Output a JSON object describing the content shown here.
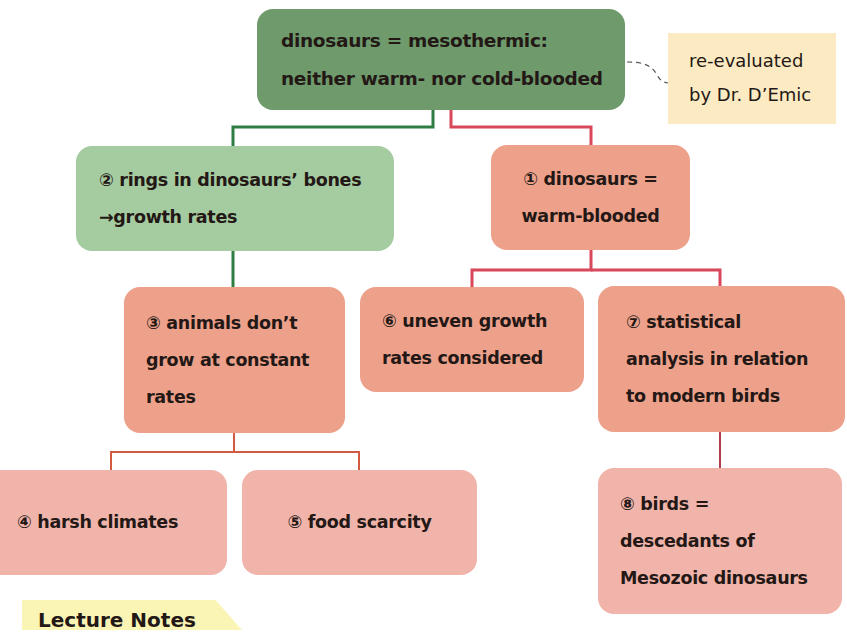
{
  "diagram": {
    "root": {
      "lines": [
        "dinosaurs = mesothermic:",
        "neither warm- nor cold-blooded"
      ],
      "color": "#6e9a6c"
    },
    "note": {
      "lines": [
        "re-evaluated",
        "by Dr. D’Emic"
      ],
      "color": "#fbeac2"
    },
    "nodes": {
      "n1": {
        "lines": [
          "① dinosaurs =",
          "warm-blooded"
        ],
        "color": "#eda08a"
      },
      "n2": {
        "lines": [
          "② rings in dinosaurs’ bones",
          "→growth rates"
        ],
        "color": "#a5cba0"
      },
      "n3": {
        "lines": [
          "③ animals don’t",
          "grow at constant",
          "rates"
        ],
        "color": "#eda08a"
      },
      "n4": {
        "lines": [
          "④ harsh climates"
        ],
        "color": "#f1b4aa"
      },
      "n5": {
        "lines": [
          "⑤ food scarcity"
        ],
        "color": "#f1b4aa"
      },
      "n6": {
        "lines": [
          "⑥ uneven growth",
          "rates considered"
        ],
        "color": "#eda08a"
      },
      "n7": {
        "lines": [
          "⑦ statistical",
          "analysis in relation",
          "to modern birds"
        ],
        "color": "#eda08a"
      },
      "n8": {
        "lines": [
          "⑧ birds =",
          "descedants of",
          "Mesozoic dinosaurs"
        ],
        "color": "#f1b4aa"
      }
    },
    "edges": [
      {
        "from": "root",
        "to": "n2",
        "color": "#2e7d43"
      },
      {
        "from": "root",
        "to": "n1",
        "color": "#d9475a"
      },
      {
        "from": "n2",
        "to": "n3",
        "color": "#2e7d43"
      },
      {
        "from": "n1",
        "to": "n6",
        "color": "#d9475a"
      },
      {
        "from": "n1",
        "to": "n7",
        "color": "#d9475a"
      },
      {
        "from": "n3",
        "to": "n4",
        "color": "#d25a3e"
      },
      {
        "from": "n3",
        "to": "n5",
        "color": "#d25a3e"
      },
      {
        "from": "n7",
        "to": "n8",
        "color": "#b23a4e"
      },
      {
        "from": "root",
        "to": "note",
        "style": "dashed",
        "color": "#555555"
      }
    ]
  },
  "footer_tab": {
    "label": "Lecture Notes"
  }
}
